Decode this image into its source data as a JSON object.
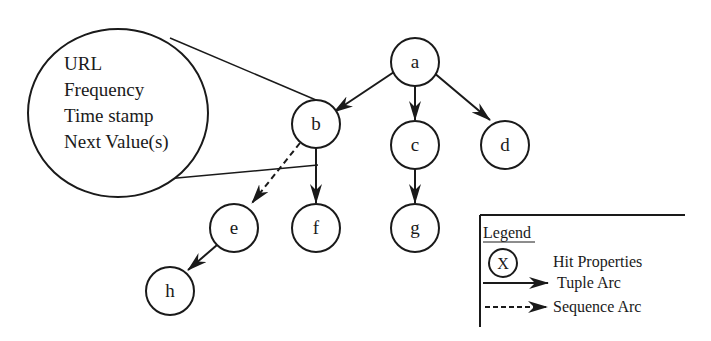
{
  "diagram": {
    "type": "tree",
    "nodes": [
      {
        "id": "a",
        "label": "a",
        "cx": 415,
        "cy": 62
      },
      {
        "id": "b",
        "label": "b",
        "cx": 316,
        "cy": 124
      },
      {
        "id": "c",
        "label": "c",
        "cx": 415,
        "cy": 145
      },
      {
        "id": "d",
        "label": "d",
        "cx": 505,
        "cy": 145
      },
      {
        "id": "e",
        "label": "e",
        "cx": 234,
        "cy": 228
      },
      {
        "id": "f",
        "label": "f",
        "cx": 316,
        "cy": 228
      },
      {
        "id": "g",
        "label": "g",
        "cx": 415,
        "cy": 228
      },
      {
        "id": "h",
        "label": "h",
        "cx": 170,
        "cy": 291
      }
    ],
    "edges": [
      {
        "from": "a",
        "to": "b",
        "type": "tuple"
      },
      {
        "from": "a",
        "to": "c",
        "type": "tuple"
      },
      {
        "from": "a",
        "to": "d",
        "type": "tuple"
      },
      {
        "from": "b",
        "to": "f",
        "type": "tuple"
      },
      {
        "from": "b",
        "to": "e",
        "type": "sequence"
      },
      {
        "from": "c",
        "to": "g",
        "type": "tuple"
      },
      {
        "from": "e",
        "to": "h",
        "type": "tuple"
      }
    ],
    "callout": {
      "attached_to": "b",
      "lines": [
        "URL",
        "Frequency",
        "Time stamp",
        "Next Value(s)"
      ]
    },
    "legend": {
      "title": "Legend",
      "node_symbol": "X",
      "items": [
        {
          "symbol": "circle",
          "label": "Hit Properties"
        },
        {
          "symbol": "solid-arrow",
          "label": "Tuple Arc"
        },
        {
          "symbol": "dashed-arrow",
          "label": "Sequence Arc"
        }
      ]
    },
    "colors": {
      "stroke": "#1a1a1a",
      "background": "#ffffff"
    }
  }
}
